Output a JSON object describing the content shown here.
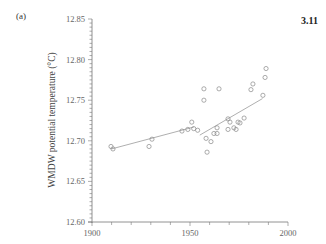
{
  "figure": {
    "panel_label": "(a)",
    "figure_number": "3.11"
  },
  "chart_data": {
    "type": "scatter",
    "title": "",
    "xlabel": "",
    "ylabel": "WMDW potential temperature (°C)",
    "xlim": [
      1900,
      2000
    ],
    "ylim": [
      12.6,
      12.85
    ],
    "x_ticks": [
      "1900",
      "1950",
      "2000"
    ],
    "y_ticks": [
      "12.60",
      "12.65",
      "12.70",
      "12.75",
      "12.80",
      "12.85"
    ],
    "grid": false,
    "legend": null,
    "series": [
      {
        "name": "observations",
        "marker": "open-circle",
        "points": [
          {
            "x": 1909.7,
            "y": 12.693
          },
          {
            "x": 1910.7,
            "y": 12.69
          },
          {
            "x": 1929.1,
            "y": 12.693
          },
          {
            "x": 1930.6,
            "y": 12.702
          },
          {
            "x": 1945.9,
            "y": 12.712
          },
          {
            "x": 1948.9,
            "y": 12.714
          },
          {
            "x": 1950.9,
            "y": 12.723
          },
          {
            "x": 1951.9,
            "y": 12.715
          },
          {
            "x": 1953.9,
            "y": 12.713
          },
          {
            "x": 1555.0,
            "y": null
          },
          {
            "x": 1557.0,
            "y": null
          },
          {
            "x": 1555.1,
            "y": 12.757
          },
          {
            "x": 1957.1,
            "y": 12.764
          },
          {
            "x": 1957.1,
            "y": 12.75
          },
          {
            "x": 1964.8,
            "y": 12.764
          },
          {
            "x": 1958.2,
            "y": 12.703
          },
          {
            "x": 1960.7,
            "y": 12.699
          },
          {
            "x": 1958.7,
            "y": 12.686
          },
          {
            "x": 1962.2,
            "y": 12.709
          },
          {
            "x": 1963.8,
            "y": 12.709
          },
          {
            "x": 1963.8,
            "y": 12.716
          },
          {
            "x": 1969.4,
            "y": 12.727
          },
          {
            "x": 1970.4,
            "y": 12.723
          },
          {
            "x": 1969.4,
            "y": 12.714
          },
          {
            "x": 1972.4,
            "y": 12.716
          },
          {
            "x": 1973.5,
            "y": 12.714
          },
          {
            "x": 1974.5,
            "y": 12.723
          },
          {
            "x": 1975.5,
            "y": 12.722
          },
          {
            "x": 1977.6,
            "y": 12.728
          },
          {
            "x": 1981.1,
            "y": 12.763
          },
          {
            "x": 1982.1,
            "y": 12.77
          },
          {
            "x": 1987.2,
            "y": 12.756
          },
          {
            "x": 1988.3,
            "y": 12.778
          },
          {
            "x": 1988.8,
            "y": 12.789
          }
        ]
      },
      {
        "name": "trend-1",
        "type": "line",
        "points": [
          {
            "x": 1910,
            "y": 12.69
          },
          {
            "x": 1952,
            "y": 12.717
          }
        ]
      },
      {
        "name": "trend-2",
        "type": "line",
        "points": [
          {
            "x": 1955,
            "y": 12.707
          },
          {
            "x": 1987,
            "y": 12.752
          }
        ]
      }
    ]
  }
}
